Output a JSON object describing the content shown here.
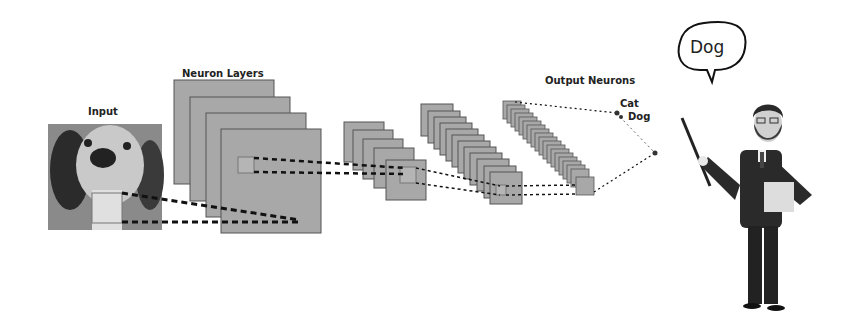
{
  "labels": {
    "input": "Input",
    "neuron_layers": "Neuron Layers",
    "output_neurons": "Output Neurons",
    "cat": "Cat",
    "dog": "Dog",
    "speech": "Dog"
  },
  "colors": {
    "layer_fill": "#a8a8a8",
    "layer_stroke": "#555555",
    "dash": "#111111",
    "suit": "#2a2a2a"
  }
}
